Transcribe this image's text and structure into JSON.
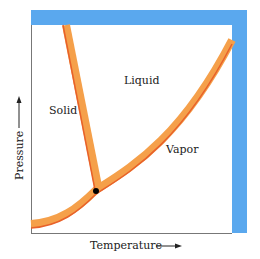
{
  "diagram": {
    "type": "phase-diagram",
    "regions": {
      "solid": "Solid",
      "liquid": "Liquid",
      "vapor": "Vapor"
    },
    "axes": {
      "x_label": "Temperature",
      "y_label": "Pressure"
    },
    "features": [
      "triple-point",
      "solid-liquid-boundary",
      "liquid-vapor-boundary",
      "solid-vapor-boundary"
    ],
    "colors": {
      "curve_fill": "#f5a04a",
      "curve_edge": "#e8612a",
      "frame": "#5aa8ee",
      "axis": "#777777",
      "triple_point": "#000000"
    }
  }
}
